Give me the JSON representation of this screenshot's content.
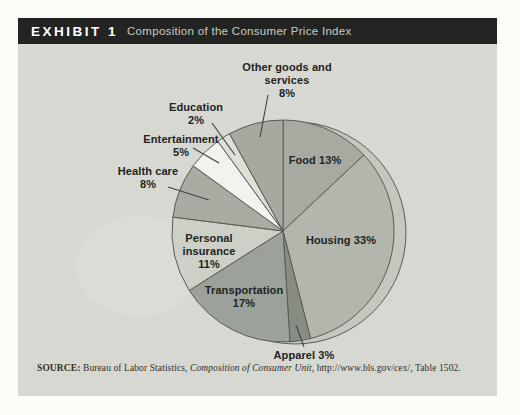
{
  "header": {
    "exhibit_label": "EXHIBIT 1",
    "title": "Composition of the Consumer Price Index",
    "bar_color": "#232421",
    "label_color": "#ffffff",
    "title_color": "#c9c9c6"
  },
  "chart_data": {
    "type": "pie",
    "title": "Composition of the Consumer Price Index",
    "start_angle_deg": 0,
    "direction": "clockwise",
    "units": "percent",
    "slices": [
      {
        "label": "Food",
        "value": 13,
        "color": "#a6aaa0"
      },
      {
        "label": "Housing",
        "value": 33,
        "color": "#b2b6ac"
      },
      {
        "label": "Apparel",
        "value": 3,
        "color": "#888d83"
      },
      {
        "label": "Transportation",
        "value": 17,
        "color": "#9ca199"
      },
      {
        "label": "Personal insurance",
        "value": 11,
        "color": "#ccd0c6"
      },
      {
        "label": "Health care",
        "value": 8,
        "color": "#a7aba1"
      },
      {
        "label": "Entertainment",
        "value": 5,
        "color": "#f2f3ee"
      },
      {
        "label": "Education",
        "value": 2,
        "color": "#dde0d6"
      },
      {
        "label": "Other goods and services",
        "value": 8,
        "color": "#a5a99f"
      }
    ],
    "stroke_color": "#5a5c54",
    "highlight_color": "#c3c7bd",
    "background_color": "#d6d8d1"
  },
  "labels": {
    "other_goods": {
      "l1": "Other goods and",
      "l2": "services",
      "l3": "8%"
    },
    "education": {
      "l1": "Education",
      "l2": "2%"
    },
    "entertainment": {
      "l1": "Entertainment",
      "l2": "5%"
    },
    "health_care": {
      "l1": "Health care",
      "l2": "8%"
    },
    "personal_insurance": {
      "l1": "Personal",
      "l2": "insurance",
      "l3": "11%"
    },
    "transportation": {
      "l1": "Transportation",
      "l2": "17%"
    },
    "housing": {
      "l1": "Housing 33%"
    },
    "food": {
      "l1": "Food 13%"
    },
    "apparel": {
      "l1": "Apparel 3%"
    }
  },
  "source": {
    "prefix": "SOURCE:",
    "text_before_italic": " Bureau of Labor Statistics, ",
    "italic": "Composition of Consumer Unit",
    "text_after_italic": ", http://www.bls.gov/cex/, Table 1502."
  }
}
